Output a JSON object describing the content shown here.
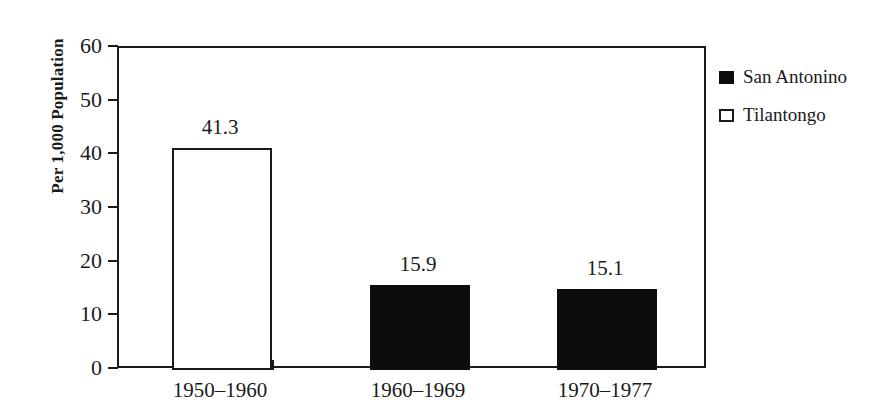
{
  "chart_data": {
    "type": "bar",
    "title": "",
    "subtitle": "",
    "xlabel": "",
    "ylabel": "Per 1,000 Population",
    "categories": [
      "1950–1960",
      "1960–1969",
      "1970–1977"
    ],
    "values": [
      41.3,
      15.9,
      15.1
    ],
    "value_labels": [
      "41.3",
      "15.9",
      "15.1"
    ],
    "bar_series": [
      "Tilantongo",
      "San Antonino",
      "San Antonino"
    ],
    "series": [
      {
        "name": "Tilantongo",
        "values": [
          41.3,
          null,
          null
        ]
      },
      {
        "name": "San Antonino",
        "values": [
          null,
          15.9,
          15.1
        ]
      }
    ],
    "ylim": [
      0,
      60
    ],
    "yticks": [
      0,
      10,
      20,
      30,
      40,
      50,
      60
    ],
    "ytick_labels": [
      "0",
      "10",
      "20",
      "30",
      "40",
      "50",
      "60"
    ],
    "grid": false,
    "legend_position": "right-top-outside",
    "annotations": []
  },
  "legend": {
    "items": [
      {
        "label": "San Antonino",
        "swatch": "filled-square",
        "color": "#0d0d0d"
      },
      {
        "label": "Tilantongo",
        "swatch": "open-square",
        "color": "#ffffff"
      }
    ]
  },
  "colors": {
    "ink": "#1a1a1a",
    "fill_dark": "#0d0d0d",
    "fill_light": "#ffffff",
    "background": "#ffffff"
  }
}
